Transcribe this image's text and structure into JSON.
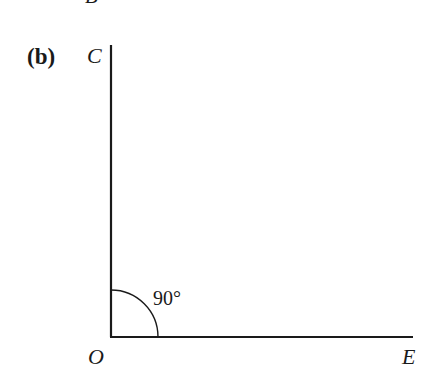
{
  "figure": {
    "part_label": "(b)",
    "cut_off_label_top": "B",
    "points": {
      "C": "C",
      "O": "O",
      "E": "E"
    },
    "angle_label": "90°",
    "colors": {
      "line": "#1a1a1a",
      "background": "#ffffff"
    }
  }
}
